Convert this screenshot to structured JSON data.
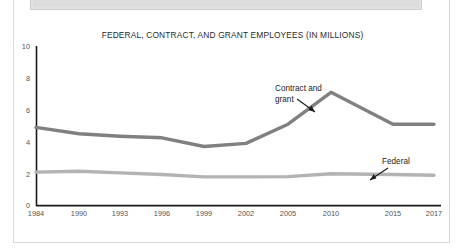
{
  "page": {
    "background_color": "#ffffff",
    "frame_color": "#d9d9d9",
    "top_block_color": "#e2e2e2"
  },
  "chart_data": {
    "type": "line",
    "title": "FEDERAL, CONTRACT, AND GRANT EMPLOYEES (IN MILLIONS)",
    "xlabel": "",
    "ylabel": "",
    "categories": [
      "1984",
      "1990",
      "1993",
      "1996",
      "1999",
      "2002",
      "2005",
      "2010",
      "2015",
      "2017"
    ],
    "xtick_labels": [
      "1984",
      "1990",
      "1993",
      "1996",
      "1999",
      "2002",
      "2005",
      "2010",
      "2015",
      "2017"
    ],
    "ytick_labels": [
      "0",
      "2",
      "4",
      "6",
      "8",
      "10"
    ],
    "ytick_values": [
      0,
      2,
      4,
      6,
      8,
      10
    ],
    "ylim": [
      0,
      10
    ],
    "grid": false,
    "legend_position": "inline-annotations",
    "series": [
      {
        "name": "Contract and grant",
        "color": "#808080",
        "line_width": 3.4,
        "values": [
          4.9,
          4.5,
          4.35,
          4.25,
          3.7,
          3.9,
          5.1,
          7.1,
          5.1,
          5.1
        ]
      },
      {
        "name": "Federal",
        "color": "#b3b3b3",
        "line_width": 3.4,
        "values": [
          2.1,
          2.15,
          2.05,
          1.95,
          1.8,
          1.8,
          1.82,
          2.0,
          1.95,
          1.9
        ]
      }
    ],
    "annotations": [
      {
        "id": "contract-and-grant",
        "line1": "Contract and",
        "line2": "grant",
        "target_series": "Contract and grant",
        "arrow": "down-right"
      },
      {
        "id": "federal",
        "line1": "Federal",
        "line2": "",
        "target_series": "Federal",
        "arrow": "down-left"
      }
    ]
  }
}
